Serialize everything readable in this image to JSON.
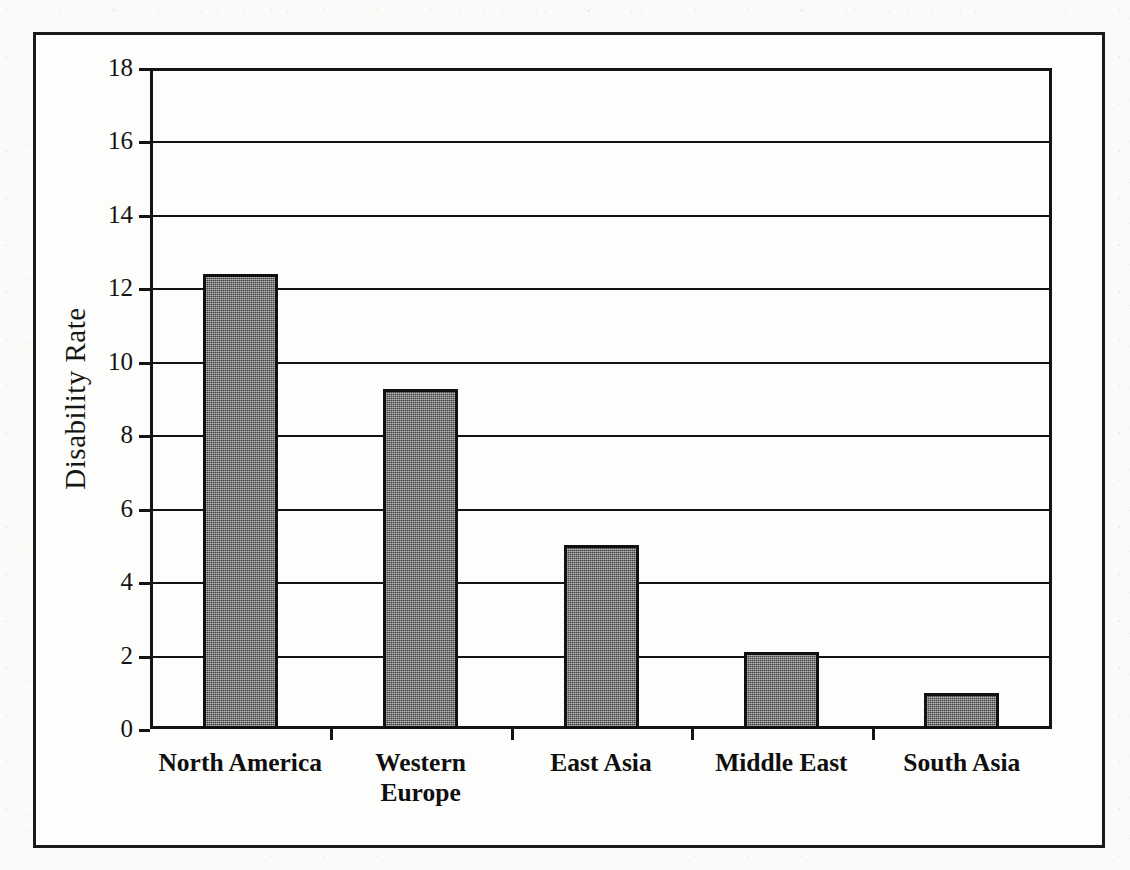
{
  "chart_data": {
    "type": "bar",
    "title": "",
    "subtitle": "",
    "xlabel": "",
    "ylabel": "Disability Rate",
    "categories": [
      "North America",
      "Western Europe",
      "East Asia",
      "Middle East",
      "South Asia"
    ],
    "values": [
      12.4,
      9.27,
      5.0,
      2.1,
      0.97
    ],
    "series": [
      {
        "name": "Disability Rate",
        "values": [
          12.4,
          9.27,
          5.0,
          2.1,
          0.97
        ]
      }
    ],
    "ylim": [
      0,
      18
    ],
    "ytick_step": 2,
    "yticks": [
      0,
      2,
      4,
      6,
      8,
      10,
      12,
      14,
      16,
      18
    ],
    "ytick_labels": [
      "0",
      "2",
      "4",
      "6",
      "8",
      "10",
      "12",
      "14",
      "16",
      "18"
    ],
    "grid": "horizontal",
    "legend": "none",
    "legend_position": "none",
    "bar_color": "#6e6e6e",
    "bar_edge_color": "#111111",
    "axis_color": "#141414",
    "background_color": "#fdfdfb",
    "frame_color": "#1a1a1a",
    "annotations": []
  },
  "category_label_lines": [
    [
      "North America"
    ],
    [
      "Western",
      "Europe"
    ],
    [
      "East Asia"
    ],
    [
      "Middle East"
    ],
    [
      "South Asia"
    ]
  ]
}
